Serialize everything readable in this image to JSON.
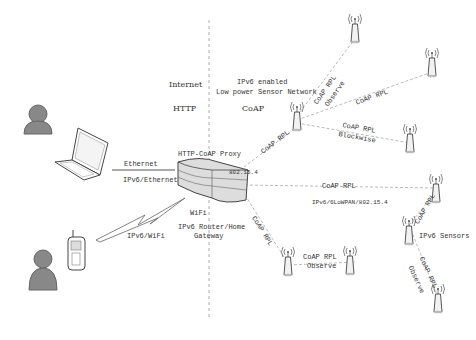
{
  "diagram": {
    "zones": {
      "left": {
        "title": "Internet",
        "protocol": "HTTP"
      },
      "right": {
        "title_line1": "IPv6 enabled",
        "title_line2": "Low power Sensor Network",
        "protocol": "CoAP"
      }
    },
    "devices": {
      "proxy_label": "HTTP-CoAP Proxy",
      "router_label_line1": "IPv6 Router/Home",
      "router_label_line2": "Gateway",
      "wifi_label": "WiFi",
      "ieee_label": "802.15.4",
      "sensors_label": "IPv6 Sensors"
    },
    "links": {
      "ethernet": "Ethernet",
      "ipv6_ethernet": "IPv6/Ethernet",
      "ipv6_wifi": "IPv6/WiFi",
      "coap_rpl": "CoAP RPL",
      "observe": "Observe",
      "blockwise": "Blockwise",
      "sixlowpan": "IPv6/6LoWPAN/802.15.4"
    },
    "colors": {
      "line": "#9a9a9a",
      "device": "#e6e6e6",
      "person": "#7a7a7a",
      "text": "#333333"
    }
  }
}
